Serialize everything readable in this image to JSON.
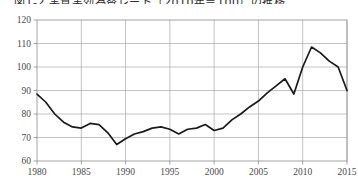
{
  "chart_data": {
    "type": "line",
    "title": "図1-2 実質実効為替レート（2010年＝100）の推移",
    "xlabel": "",
    "ylabel": "",
    "xlim": [
      1980,
      2015
    ],
    "ylim": [
      60,
      120
    ],
    "yticks": [
      60,
      70,
      80,
      90,
      100,
      110,
      120
    ],
    "xticks": [
      1980,
      1985,
      1990,
      1995,
      2000,
      2005,
      2010,
      2015
    ],
    "grid": true,
    "legend": "none",
    "line_color": "#1a1a1a",
    "x": [
      1980,
      1981,
      1982,
      1983,
      1984,
      1985,
      1986,
      1987,
      1988,
      1989,
      1990,
      1991,
      1992,
      1993,
      1994,
      1995,
      1996,
      1997,
      1998,
      1999,
      2000,
      2001,
      2002,
      2003,
      2004,
      2005,
      2006,
      2007,
      2008,
      2009,
      2010,
      2011,
      2012,
      2013,
      2014,
      2015
    ],
    "values": [
      88.5,
      85.0,
      80.0,
      76.5,
      74.5,
      74.0,
      76.0,
      75.5,
      72.0,
      67.0,
      69.5,
      71.5,
      72.5,
      74.0,
      74.5,
      73.5,
      71.5,
      73.5,
      74.0,
      75.5,
      73.0,
      74.0,
      77.5,
      80.0,
      83.0,
      85.5,
      89.0,
      92.0,
      95.0,
      88.5,
      100.0,
      108.5,
      106.0,
      102.5,
      100.0,
      90.0
    ]
  }
}
